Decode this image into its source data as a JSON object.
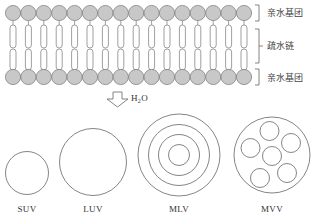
{
  "bilayer": {
    "head_count": 16,
    "head_fill": "#c8c8c8",
    "stroke": "#777777",
    "labels": {
      "top": "亲水基团",
      "middle": "疏水链",
      "bottom": "亲水基团"
    }
  },
  "arrow": {
    "label_main": "H",
    "label_sub": "2",
    "label_tail": "O"
  },
  "vesicles": [
    {
      "id": "suv",
      "label": "SUV"
    },
    {
      "id": "luv",
      "label": "LUV"
    },
    {
      "id": "mlv",
      "label": "MLV"
    },
    {
      "id": "mvv",
      "label": "MVV"
    }
  ]
}
